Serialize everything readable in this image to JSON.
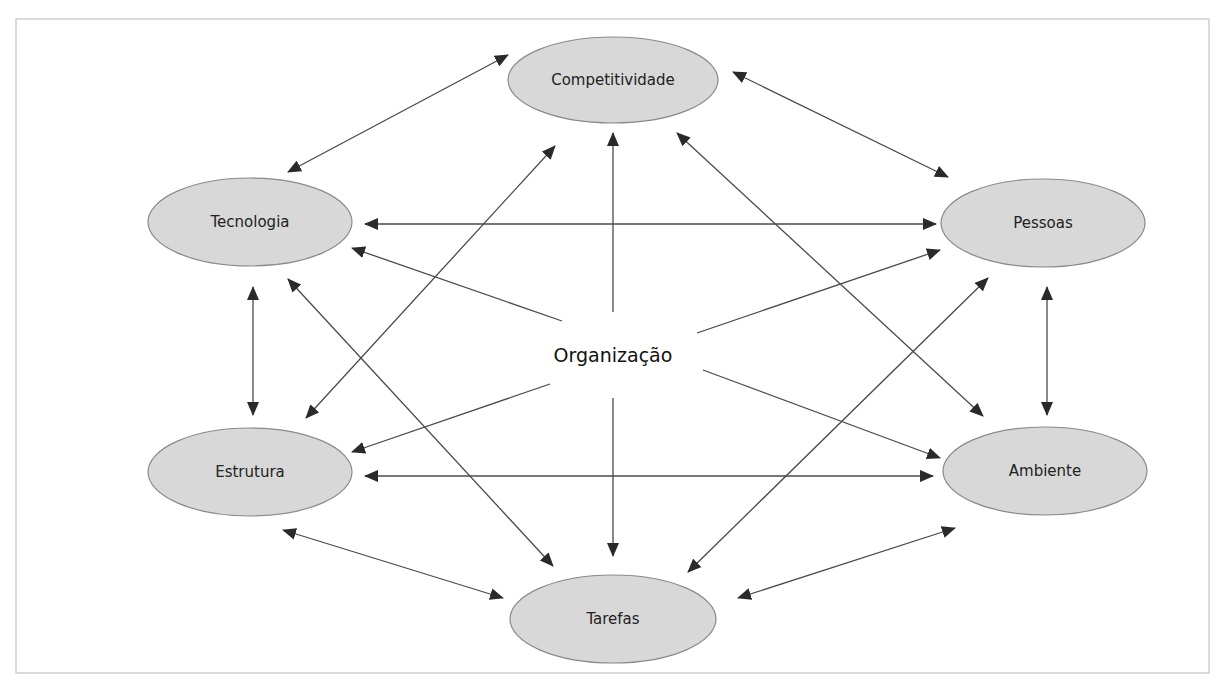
{
  "diagram": {
    "center": {
      "id": "organizacao",
      "label": "Organização",
      "x": 613,
      "y": 356
    },
    "nodes": [
      {
        "id": "competitividade",
        "label": "Competitividade",
        "x": 613,
        "y": 80,
        "rx": 105,
        "ry": 43
      },
      {
        "id": "tecnologia",
        "label": "Tecnologia",
        "x": 250,
        "y": 222,
        "rx": 102,
        "ry": 44
      },
      {
        "id": "pessoas",
        "label": "Pessoas",
        "x": 1043,
        "y": 223,
        "rx": 102,
        "ry": 44
      },
      {
        "id": "estrutura",
        "label": "Estrutura",
        "x": 250,
        "y": 472,
        "rx": 102,
        "ry": 44
      },
      {
        "id": "ambiente",
        "label": "Ambiente",
        "x": 1045,
        "y": 471,
        "rx": 102,
        "ry": 44
      },
      {
        "id": "tarefas",
        "label": "Tarefas",
        "x": 613,
        "y": 619,
        "rx": 103,
        "ry": 44
      }
    ],
    "edges": [
      {
        "from": "competitividade",
        "to": "tecnologia",
        "type": "bidirectional",
        "x1": 508,
        "y1": 55,
        "x2": 288,
        "y2": 172
      },
      {
        "from": "competitividade",
        "to": "pessoas",
        "type": "bidirectional",
        "x1": 733,
        "y1": 72,
        "x2": 948,
        "y2": 177
      },
      {
        "from": "tecnologia",
        "to": "pessoas",
        "type": "bidirectional",
        "x1": 365,
        "y1": 224,
        "x2": 936,
        "y2": 224
      },
      {
        "from": "organizacao",
        "to": "tecnologia",
        "type": "directed",
        "x1": 562,
        "y1": 321,
        "x2": 352,
        "y2": 248
      },
      {
        "from": "organizacao",
        "to": "competitividade",
        "type": "directed",
        "x1": 613,
        "y1": 312,
        "x2": 613,
        "y2": 133
      },
      {
        "from": "organizacao",
        "to": "pessoas",
        "type": "directed",
        "x1": 697,
        "y1": 333,
        "x2": 940,
        "y2": 250
      },
      {
        "from": "estrutura",
        "to": "competitividade",
        "type": "bidirectional",
        "x1": 306,
        "y1": 418,
        "x2": 555,
        "y2": 146
      },
      {
        "from": "tecnologia",
        "to": "tarefas",
        "type": "bidirectional",
        "x1": 288,
        "y1": 279,
        "x2": 553,
        "y2": 566
      },
      {
        "from": "competitividade",
        "to": "ambiente",
        "type": "bidirectional",
        "x1": 677,
        "y1": 133,
        "x2": 983,
        "y2": 416
      },
      {
        "from": "pessoas",
        "to": "tarefas",
        "type": "bidirectional",
        "x1": 988,
        "y1": 278,
        "x2": 688,
        "y2": 572
      },
      {
        "from": "tecnologia",
        "to": "estrutura",
        "type": "bidirectional",
        "x1": 253,
        "y1": 287,
        "x2": 253,
        "y2": 415
      },
      {
        "from": "pessoas",
        "to": "ambiente",
        "type": "bidirectional",
        "x1": 1047,
        "y1": 287,
        "x2": 1047,
        "y2": 415
      },
      {
        "from": "organizacao",
        "to": "estrutura",
        "type": "directed",
        "x1": 550,
        "y1": 384,
        "x2": 352,
        "y2": 452
      },
      {
        "from": "estrutura",
        "to": "ambiente",
        "type": "bidirectional",
        "x1": 365,
        "y1": 476,
        "x2": 933,
        "y2": 476
      },
      {
        "from": "organizacao",
        "to": "ambiente",
        "type": "directed",
        "x1": 703,
        "y1": 370,
        "x2": 940,
        "y2": 458
      },
      {
        "from": "organizacao",
        "to": "tarefas",
        "type": "directed",
        "x1": 613,
        "y1": 398,
        "x2": 613,
        "y2": 556
      },
      {
        "from": "estrutura",
        "to": "tarefas",
        "type": "bidirectional",
        "x1": 283,
        "y1": 530,
        "x2": 503,
        "y2": 598
      },
      {
        "from": "ambiente",
        "to": "tarefas",
        "type": "bidirectional",
        "x1": 955,
        "y1": 528,
        "x2": 738,
        "y2": 598
      }
    ],
    "colors": {
      "node_fill": "#d8d8d8",
      "node_stroke": "#8a8a8a",
      "edge": "#4a4a4a",
      "arrowhead": "#2a2a2a",
      "frame": "#c4c4c4",
      "text": "#222222"
    },
    "frame": {
      "x": 16,
      "y": 19,
      "width": 1193,
      "height": 654
    }
  }
}
